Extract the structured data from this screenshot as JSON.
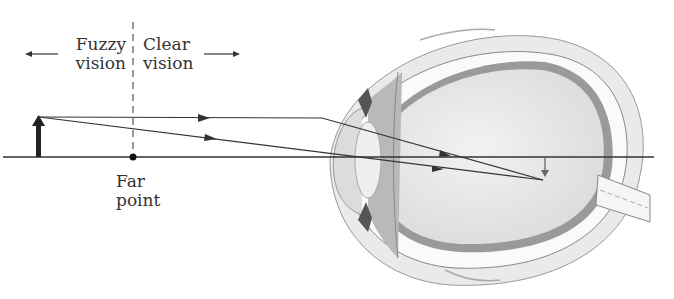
{
  "labels": {
    "fuzzy_line1": "Fuzzy",
    "fuzzy_line2": "vision",
    "clear_line1": "Clear",
    "clear_line2": "vision",
    "far_line1": "Far",
    "far_line2": "point"
  },
  "diagram": {
    "elements": [
      "object-arrow",
      "optical-axis",
      "far-point",
      "boundary-dashed-line",
      "light-rays",
      "eye-cross-section",
      "image-arrow"
    ]
  }
}
